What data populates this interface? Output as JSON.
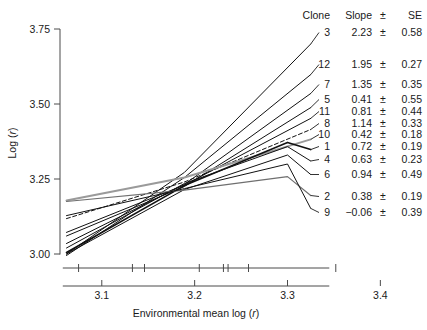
{
  "chart_data": {
    "type": "line",
    "title": "",
    "xlabel": "Environmental mean log (r)",
    "ylabel": "Log (r)",
    "xlim": [
      3.055,
      3.335
    ],
    "ylim": [
      2.93,
      3.8
    ],
    "xticks": [
      3.1,
      3.2,
      3.3,
      3.4
    ],
    "xticklabels": [
      "3.1",
      "3.2",
      "3.3",
      "3.4"
    ],
    "yticks": [
      3.0,
      3.25,
      3.5,
      3.75
    ],
    "yticklabels": [
      "3.00",
      "3.25",
      "3.50",
      "3.75"
    ],
    "grid": false,
    "legend_position": "right-table",
    "rug_values": [
      3.075,
      3.133,
      3.146,
      3.205,
      3.231,
      3.236,
      3.258,
      3.352
    ],
    "table": {
      "headers": [
        "Clone",
        "Slope",
        "±",
        "SE"
      ],
      "rows": [
        {
          "clone": "3",
          "slope": "2.23",
          "pm": "±",
          "se": "0.58"
        },
        {
          "clone": "12",
          "slope": "1.95",
          "pm": "±",
          "se": "0.27"
        },
        {
          "clone": "7",
          "slope": "1.35",
          "pm": "±",
          "se": "0.35"
        },
        {
          "clone": "5",
          "slope": "0.41",
          "pm": "±",
          "se": "0.55"
        },
        {
          "clone": "11",
          "slope": "0.81",
          "pm": "±",
          "se": "0.44"
        },
        {
          "clone": "8",
          "slope": "1.14",
          "pm": "±",
          "se": "0.33"
        },
        {
          "clone": "10",
          "slope": "0.42",
          "pm": "±",
          "se": "0.18"
        },
        {
          "clone": "1",
          "slope": "0.72",
          "pm": "±",
          "se": "0.19"
        },
        {
          "clone": "4",
          "slope": "0.63",
          "pm": "±",
          "se": "0.23"
        },
        {
          "clone": "6",
          "slope": "0.94",
          "pm": "±",
          "se": "0.49"
        },
        {
          "clone": "2",
          "slope": "0.38",
          "pm": "±",
          "se": "0.19"
        },
        {
          "clone": "9",
          "slope": "-0.06",
          "pm": "±",
          "se": "0.39"
        }
      ]
    },
    "series": [
      {
        "name": "3",
        "style": "solid",
        "color": "#111111",
        "width": 1.0,
        "x": [
          3.062,
          3.189,
          3.325
        ],
        "y": [
          3.0,
          3.272,
          3.7
        ]
      },
      {
        "name": "12",
        "style": "solid",
        "color": "#111111",
        "width": 1.0,
        "x": [
          3.062,
          3.189,
          3.325
        ],
        "y": [
          2.995,
          3.255,
          3.598
        ]
      },
      {
        "name": "7",
        "style": "solid",
        "color": "#111111",
        "width": 1.0,
        "x": [
          3.062,
          3.189,
          3.325
        ],
        "y": [
          3.035,
          3.232,
          3.535
        ]
      },
      {
        "name": "5",
        "style": "solid",
        "color": "#111111",
        "width": 1.0,
        "x": [
          3.062,
          3.189,
          3.325
        ],
        "y": [
          3.06,
          3.225,
          3.488
        ]
      },
      {
        "name": "11",
        "style": "solid",
        "color": "#111111",
        "width": 1.0,
        "x": [
          3.062,
          3.189,
          3.325
        ],
        "y": [
          3.072,
          3.23,
          3.452
        ]
      },
      {
        "name": "8",
        "style": "dashed",
        "color": "#111111",
        "width": 1.0,
        "x": [
          3.062,
          3.189,
          3.325
        ],
        "y": [
          3.118,
          3.24,
          3.415
        ]
      },
      {
        "name": "10",
        "style": "solid",
        "color": "#9a9a9a",
        "width": 2.0,
        "x": [
          3.062,
          3.189,
          3.325
        ],
        "y": [
          3.178,
          3.255,
          3.382
        ]
      },
      {
        "name": "1",
        "style": "solid",
        "color": "#111111",
        "width": 1.6,
        "x": [
          3.062,
          3.189,
          3.3,
          3.325
        ],
        "y": [
          3.005,
          3.228,
          3.372,
          3.348
        ]
      },
      {
        "name": "4",
        "style": "solid",
        "color": "#111111",
        "width": 1.0,
        "x": [
          3.062,
          3.189,
          3.3,
          3.325
        ],
        "y": [
          3.02,
          3.235,
          3.358,
          3.31
        ]
      },
      {
        "name": "6",
        "style": "solid",
        "color": "#111111",
        "width": 1.0,
        "x": [
          3.062,
          3.189,
          3.3,
          3.325
        ],
        "y": [
          3.0,
          3.215,
          3.33,
          3.265
        ]
      },
      {
        "name": "2",
        "style": "solid",
        "color": "#6f6f6f",
        "width": 1.2,
        "x": [
          3.062,
          3.189,
          3.3,
          3.325
        ],
        "y": [
          3.175,
          3.213,
          3.258,
          3.195
        ]
      },
      {
        "name": "9",
        "style": "solid",
        "color": "#111111",
        "width": 1.0,
        "x": [
          3.062,
          3.189,
          3.3,
          3.325
        ],
        "y": [
          3.128,
          3.218,
          3.3,
          3.152
        ]
      }
    ]
  }
}
